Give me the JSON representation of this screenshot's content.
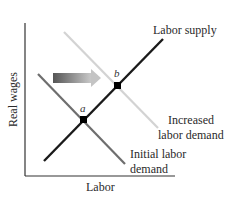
{
  "diagram": {
    "type": "supply-demand",
    "axes": {
      "x_label": "Labor",
      "y_label": "Real wages"
    },
    "curves": [
      {
        "id": "labor-supply",
        "label": "Labor supply",
        "color": "#1a1a1a"
      },
      {
        "id": "initial-labor-demand",
        "label_line1": "Initial labor",
        "label_line2": "demand",
        "color": "#666666"
      },
      {
        "id": "increased-labor-demand",
        "label_line1": "Increased",
        "label_line2": "labor demand",
        "color": "#d0d0d0"
      }
    ],
    "points": [
      {
        "id": "a",
        "label": "a"
      },
      {
        "id": "b",
        "label": "b"
      }
    ],
    "shift_arrow": {
      "direction": "right",
      "color_start": "#555555",
      "color_end": "#c8c8c8"
    }
  }
}
